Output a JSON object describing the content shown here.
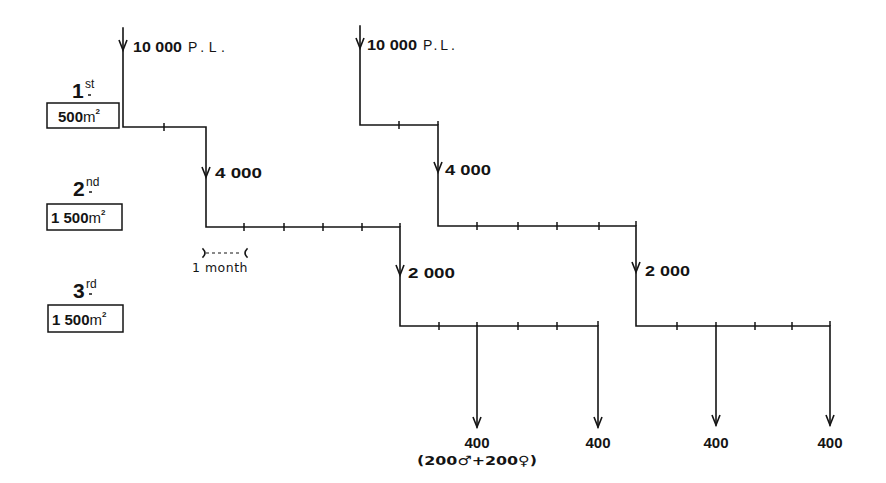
{
  "stages": [
    {
      "ordinal": "1",
      "suffix": "st",
      "area": "500",
      "unit": "m",
      "exponent": "2"
    },
    {
      "ordinal": "2",
      "suffix": "nd",
      "area": "1 500",
      "unit": "m",
      "exponent": "2"
    },
    {
      "ordinal": "3",
      "suffix": "rd",
      "area": "1 500",
      "unit": "m",
      "exponent": "2"
    }
  ],
  "scale": {
    "label": "1 month"
  },
  "cycles": [
    {
      "stock": "10 000",
      "stock_unit": "P.L.",
      "transfer_2nd": "4 000",
      "transfer_3rd": "2 000",
      "harvests": [
        "400",
        "400"
      ],
      "harvest_note": "(200♂+200♀)"
    },
    {
      "stock": "10 000",
      "stock_unit": "P.L.",
      "transfer_2nd": "4 000",
      "transfer_3rd": "2 000",
      "harvests": [
        "400",
        "400"
      ]
    }
  ]
}
